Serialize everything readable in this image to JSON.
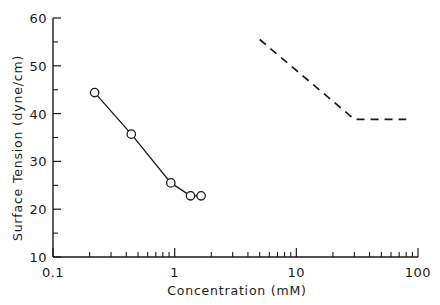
{
  "chart_data": {
    "type": "line",
    "title": "",
    "xlabel": "Concentration  (mM)",
    "ylabel": "Surface  Tension  (dyne/cm)",
    "xscale": "log",
    "yscale": "linear",
    "xlim": [
      0.1,
      100
    ],
    "ylim": [
      10,
      60
    ],
    "grid": false,
    "legend": "none",
    "xticklabels": [
      "0.1",
      "1",
      "10",
      "100"
    ],
    "xtickvalues": [
      0.1,
      1,
      10,
      100
    ],
    "yticklabels": [
      "10",
      "20",
      "30",
      "40",
      "50",
      "60"
    ],
    "ytickvalues": [
      10,
      20,
      30,
      40,
      50,
      60
    ],
    "series": [
      {
        "name": "measured surface tension",
        "style": "solid-with-open-circle-markers",
        "markers": true,
        "x": [
          0.22,
          0.44,
          0.93,
          1.35,
          1.65
        ],
        "y": [
          44.4,
          35.7,
          25.5,
          22.8,
          22.8
        ]
      },
      {
        "name": "reference dashed curve",
        "style": "dashed-no-markers",
        "markers": false,
        "x": [
          5.0,
          30.0,
          80.0
        ],
        "y": [
          55.5,
          38.8,
          38.8
        ]
      }
    ]
  },
  "axis": {
    "y_title": "Surface  Tension  (dyne/cm)",
    "x_title": "Concentration  (mM)",
    "y_labels": [
      "60",
      "50",
      "40",
      "30",
      "20",
      "10"
    ],
    "x_labels": [
      "0.1",
      "1",
      "10",
      "100"
    ]
  }
}
